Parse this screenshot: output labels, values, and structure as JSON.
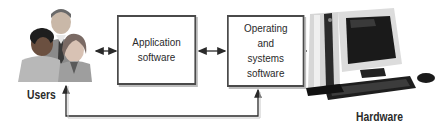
{
  "diagram": {
    "type": "block-flow",
    "nodes": [
      {
        "id": "users",
        "label": "Users",
        "kind": "image",
        "icon": "users-group-icon"
      },
      {
        "id": "application",
        "label_lines": [
          "Application",
          "software"
        ],
        "kind": "box"
      },
      {
        "id": "os",
        "label_lines": [
          "Operating",
          "and",
          "systems",
          "software"
        ],
        "kind": "box"
      },
      {
        "id": "hardware",
        "label": "Hardware",
        "kind": "image",
        "icon": "desktop-computer-icon"
      }
    ],
    "edges": [
      {
        "from": "users",
        "to": "application",
        "style": "bidirectional"
      },
      {
        "from": "application",
        "to": "os",
        "style": "bidirectional"
      },
      {
        "from": "os",
        "to": "hardware",
        "style": "bidirectional"
      },
      {
        "from": "os",
        "to": "users",
        "style": "feedback-loop",
        "arrows": "both-ends-up"
      }
    ],
    "colors": {
      "stroke": "#2a2a2a",
      "box_border": "#4a4a4a",
      "shadow": "#bdbdbd",
      "background": "#ffffff"
    }
  }
}
